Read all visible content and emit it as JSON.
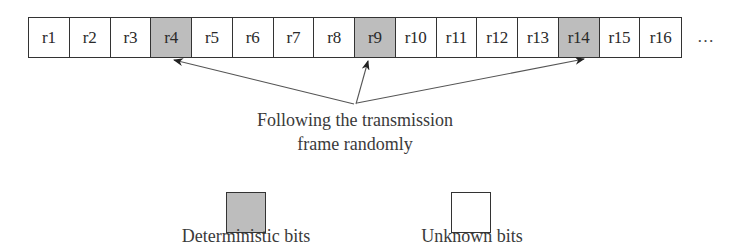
{
  "frame": {
    "cells": [
      {
        "label": "r1",
        "type": "unknown"
      },
      {
        "label": "r2",
        "type": "unknown"
      },
      {
        "label": "r3",
        "type": "unknown"
      },
      {
        "label": "r4",
        "type": "deterministic"
      },
      {
        "label": "r5",
        "type": "unknown"
      },
      {
        "label": "r6",
        "type": "unknown"
      },
      {
        "label": "r7",
        "type": "unknown"
      },
      {
        "label": "r8",
        "type": "unknown"
      },
      {
        "label": "r9",
        "type": "deterministic"
      },
      {
        "label": "r10",
        "type": "unknown"
      },
      {
        "label": "r11",
        "type": "unknown"
      },
      {
        "label": "r12",
        "type": "unknown"
      },
      {
        "label": "r13",
        "type": "unknown"
      },
      {
        "label": "r14",
        "type": "deterministic"
      },
      {
        "label": "r15",
        "type": "unknown"
      },
      {
        "label": "r16",
        "type": "unknown"
      }
    ],
    "continuation": "…"
  },
  "annotation": {
    "line1": "Following the transmission",
    "line2": "frame randomly",
    "arrow_targets": [
      "r4",
      "r9",
      "r14"
    ]
  },
  "legend": {
    "deterministic": {
      "label": "Deterministic bits",
      "color": "#bdbdbd"
    },
    "unknown": {
      "label": "Unknown bits",
      "color": "#ffffff"
    }
  }
}
